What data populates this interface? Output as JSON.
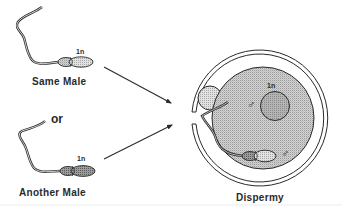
{
  "figure": {
    "type": "biology-diagram",
    "topic": "Dispermy"
  },
  "left_panel": {
    "sperm_top": {
      "label": "Same Male",
      "ploidy": "1n"
    },
    "connector": "or",
    "sperm_bottom": {
      "label": "Another Male",
      "ploidy": "1n"
    }
  },
  "egg": {
    "label": "Dispermy",
    "pronucleus_ploidy": "1n",
    "male_symbol_pronucleus": "♂",
    "male_symbol_sperm": "♂"
  },
  "colors": {
    "stroke": "#2a2a2a",
    "cytoplasm": "#c9c9c9",
    "pronucleus": "#a9a9a9",
    "sperm_head_light": "#d4d4d4",
    "sperm_head_dark": "#8e8e8e",
    "polar_body": "#d0d0d0",
    "scan_line": "#e4e4e4"
  }
}
